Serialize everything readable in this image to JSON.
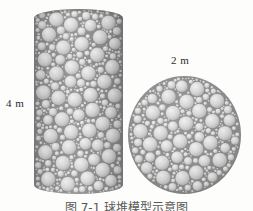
{
  "figure": {
    "background_color": "#fdfdfc",
    "caption": "图 7-1  球堆模型示意图",
    "caption_clipped": true
  },
  "labels": {
    "cylinder_height": "4 m",
    "circle_diameter": "2 m"
  },
  "shapes": {
    "cylinder": {
      "name": "packed-cylinder",
      "fill_color": "#8c8c8c",
      "sphere_color": "#d8d8d8",
      "x": 34,
      "y": 9,
      "width": 89,
      "height": 185
    },
    "circle": {
      "name": "packed-circle",
      "fill_color": "#8c8c8c",
      "sphere_color": "#d8d8d8",
      "x": 128,
      "y": 76,
      "width": 113,
      "height": 118
    }
  },
  "chart_data": {
    "type": "diagram",
    "title": "图 7-1  球堆模型示意图",
    "annotations": [
      {
        "text": "4 m",
        "target": "cylinder-height"
      },
      {
        "text": "2 m",
        "target": "circle-diameter"
      }
    ],
    "objects": [
      {
        "shape": "cylinder",
        "label": "4 m",
        "property": "height",
        "value": 4,
        "unit": "m"
      },
      {
        "shape": "circle",
        "label": "2 m",
        "property": "diameter",
        "value": 2,
        "unit": "m"
      }
    ]
  }
}
